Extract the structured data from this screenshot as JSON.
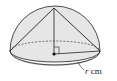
{
  "diagram": {
    "type": "hemisphere-with-inscribed-cone",
    "label_variable": "r",
    "label_unit": " cm",
    "colors": {
      "hemisphere_fill": "#e4e4e4",
      "base_fill": "#d6d6d6",
      "stroke": "#222222",
      "cone_fill": "#ececec"
    }
  }
}
